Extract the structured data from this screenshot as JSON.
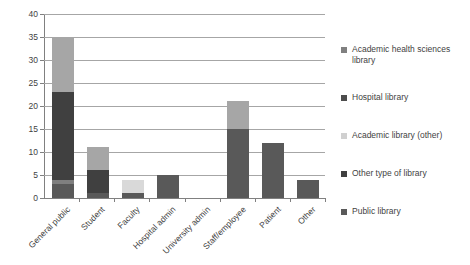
{
  "chart_data": {
    "type": "bar",
    "subtype": "stacked-vertical-bar",
    "title": "",
    "xlabel": "",
    "ylabel": "",
    "ylim": [
      0,
      40
    ],
    "ytick_step": 5,
    "yticks": [
      0,
      5,
      10,
      15,
      20,
      25,
      30,
      35,
      40
    ],
    "ytick_labels": [
      "0",
      "5",
      "10",
      "15",
      "20",
      "25",
      "30",
      "35",
      "40"
    ],
    "grid": "horizontal",
    "legend_position": "right",
    "categories": [
      "General public",
      "Student",
      "Faculty",
      "Hospital admin",
      "University admin",
      "Staff/employee",
      "Patient",
      "Other"
    ],
    "series": [
      {
        "name": "Public library",
        "color": "#595959",
        "values": [
          3,
          1,
          1,
          5,
          0,
          15,
          12,
          4
        ]
      },
      {
        "name": "Other type of library",
        "color": "#7f7f7f",
        "values": [
          1,
          0,
          0,
          0,
          0,
          0,
          0,
          0
        ]
      },
      {
        "name": "Academic library (other)",
        "color": "#d9d9d9",
        "values": [
          0,
          0,
          3,
          0,
          0,
          0,
          0,
          0
        ]
      },
      {
        "name": "Hospital library",
        "color": "#404040",
        "values": [
          19,
          5,
          0,
          0,
          0,
          0,
          0,
          0
        ]
      },
      {
        "name": "Academic health sciences library",
        "color": "#a6a6a6",
        "values": [
          12,
          5,
          0,
          0,
          0,
          6,
          0,
          0
        ]
      }
    ],
    "totals": [
      35,
      11,
      4,
      5,
      0,
      21,
      12,
      4
    ]
  },
  "legend": {
    "items": [
      {
        "label": "Academic health sciences library",
        "color": "#808080"
      },
      {
        "label": "Hospital library",
        "color": "#4d4d4d"
      },
      {
        "label": "Academic library (other)",
        "color": "#d0d0d0"
      },
      {
        "label": "Other type of library",
        "color": "#3f3f3f"
      },
      {
        "label": "Public library",
        "color": "#595959"
      }
    ]
  },
  "axes": {
    "y_tick_labels": [
      "0",
      "5",
      "10",
      "15",
      "20",
      "25",
      "30",
      "35",
      "40"
    ],
    "x_tick_labels": [
      "General public",
      "Student",
      "Faculty",
      "Hospital admin",
      "University admin",
      "Staff/employee",
      "Patient",
      "Other"
    ]
  },
  "colors": {
    "grid": "#a6a6a6",
    "axis": "#808080",
    "text": "#3f3f3f",
    "background": "#ffffff"
  }
}
